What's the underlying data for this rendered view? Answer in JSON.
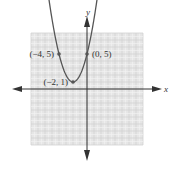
{
  "chart_data": {
    "type": "line",
    "title": "",
    "xlabel": "x",
    "ylabel": "y",
    "xlim": [
      -8,
      8
    ],
    "ylim": [
      -8,
      8
    ],
    "grid": true,
    "function": "y = (x + 2)^2 + 1",
    "series": [
      {
        "name": "parabola",
        "coefficients": {
          "a": 1,
          "h": -2,
          "k": 1
        },
        "x_range": [
          -5.6,
          1.6
        ]
      }
    ],
    "points": [
      {
        "x": -4,
        "y": 5,
        "label": "(−4, 5)",
        "label_side": "left"
      },
      {
        "x": 0,
        "y": 5,
        "label": "(0, 5)",
        "label_side": "right"
      },
      {
        "x": -2,
        "y": 1,
        "label": "(−2, 1)",
        "label_side": "left"
      }
    ],
    "colors": {
      "curve": "#555555",
      "axes": "#333333",
      "grid_bg": "#e6e6e6",
      "grid_minor": "#f4f4f4",
      "grid_major": "#d2d2d2"
    }
  }
}
